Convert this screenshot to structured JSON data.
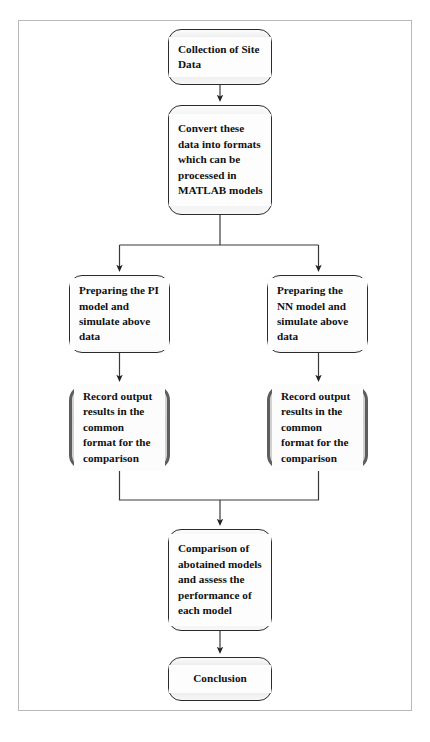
{
  "diagram": {
    "type": "flowchart",
    "orientation": "top-to-bottom",
    "frame": {
      "border_color": "#b9b9b9",
      "background": "#ffffff"
    },
    "styles": {
      "default_border_color": "#2b2b2b",
      "default_fill": "#e8e8e8",
      "label_panel_fill": "#fdfdfd",
      "emphasis_border_color": "#5e5e5e",
      "emphasis_fill": "#d2d2d2",
      "connector_color": "#3a3a3a",
      "text_color": "#111111"
    },
    "nodes": [
      {
        "id": "collection",
        "label": "Collection of Site Data",
        "emphasis": false,
        "align": "left"
      },
      {
        "id": "convert",
        "label": "Convert these data into formats which can be processed in MATLAB models",
        "emphasis": false,
        "align": "left"
      },
      {
        "id": "pi_model",
        "label": "Preparing the PI model and simulate above data",
        "emphasis": false,
        "align": "left"
      },
      {
        "id": "nn_model",
        "label": "Preparing the NN model and simulate above data",
        "emphasis": false,
        "align": "left"
      },
      {
        "id": "record_left",
        "label": "Record output results in the common format for the comparison",
        "emphasis": true,
        "align": "left"
      },
      {
        "id": "record_right",
        "label": "Record output results in the common format for the comparison",
        "emphasis": true,
        "align": "left"
      },
      {
        "id": "comparison",
        "label": "Comparison of abotained models and assess the performance of each model",
        "emphasis": false,
        "align": "left"
      },
      {
        "id": "conclusion",
        "label": "Conclusion",
        "emphasis": false,
        "align": "center"
      }
    ],
    "edges": [
      {
        "from": "collection",
        "to": "convert",
        "kind": "straight",
        "arrow": true
      },
      {
        "from": "convert",
        "to": "pi_model",
        "kind": "split-left",
        "arrow": true
      },
      {
        "from": "convert",
        "to": "nn_model",
        "kind": "split-right",
        "arrow": true
      },
      {
        "from": "pi_model",
        "to": "record_left",
        "kind": "straight",
        "arrow": true
      },
      {
        "from": "nn_model",
        "to": "record_right",
        "kind": "straight",
        "arrow": true
      },
      {
        "from": "record_left",
        "to": "comparison",
        "kind": "merge-left",
        "arrow": true
      },
      {
        "from": "record_right",
        "to": "comparison",
        "kind": "merge-right",
        "arrow": true
      },
      {
        "from": "comparison",
        "to": "conclusion",
        "kind": "straight",
        "arrow": true
      }
    ]
  }
}
